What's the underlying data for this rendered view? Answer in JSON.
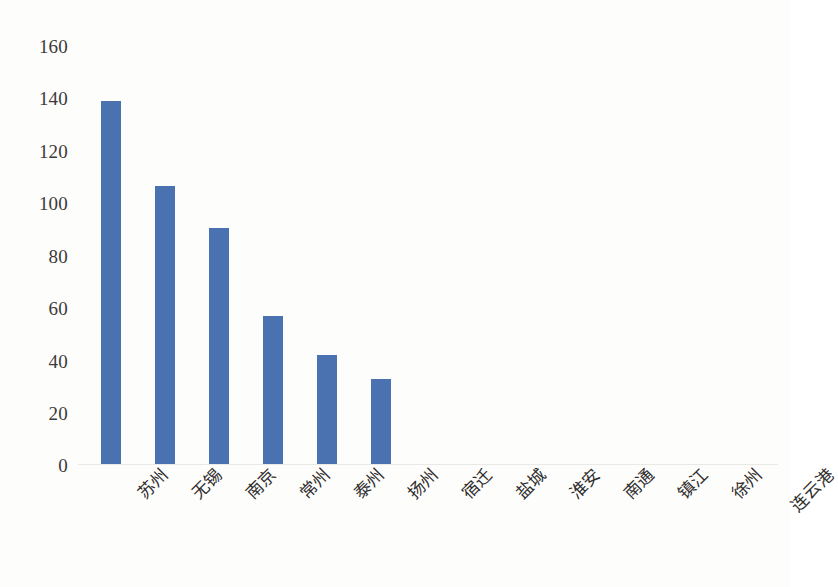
{
  "chart_data": {
    "type": "bar",
    "title": "",
    "subtitle": "",
    "xlabel": "",
    "ylabel": "",
    "ylim": [
      0,
      160
    ],
    "ytick_step": 20,
    "yticks": [
      0,
      20,
      40,
      60,
      80,
      100,
      120,
      140,
      160
    ],
    "ytick_labels": [
      "0",
      "20",
      "40",
      "60",
      "80",
      "100",
      "120",
      "140",
      "160"
    ],
    "grid": false,
    "legend": false,
    "legend_position": "none",
    "categories": [
      "苏州",
      "无锡",
      "南京",
      "常州",
      "泰州",
      "扬州",
      "宿迁",
      "盐城",
      "淮安",
      "南通",
      "镇江",
      "徐州",
      "连云港"
    ],
    "values": [
      137,
      105,
      89,
      56,
      41,
      32,
      0,
      0,
      0,
      0,
      0,
      0,
      0
    ],
    "series": [
      {
        "name": "",
        "color": "#4a72b0",
        "values": [
          137,
          105,
          89,
          56,
          41,
          32,
          0,
          0,
          0,
          0,
          0,
          0,
          0
        ]
      }
    ]
  },
  "colors": {
    "bar": "#4a72b0",
    "axis_line": "#e9e9e6",
    "tick_text": "#3c3a38",
    "category_text": "#2f2d2c",
    "background": "#fdfdfc"
  }
}
